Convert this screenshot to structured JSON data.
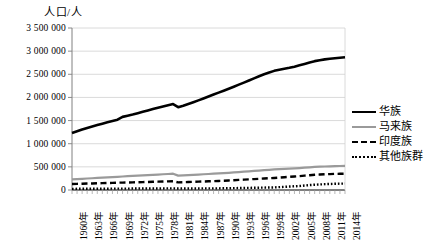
{
  "chart": {
    "axis_title": "人口/人",
    "legend_position": "right"
  },
  "chart_data": {
    "type": "line",
    "title": "",
    "xlabel": "",
    "ylabel": "人口/人",
    "ylim": [
      0,
      3500000
    ],
    "ytick_labels": [
      "0",
      "500 000",
      "1 000 000",
      "1 500 000",
      "2 000 000",
      "2 500 000",
      "3 000 000",
      "3 500 000"
    ],
    "ytick_values": [
      0,
      500000,
      1000000,
      1500000,
      2000000,
      2500000,
      3000000,
      3500000
    ],
    "grid": true,
    "legend": [
      "华族",
      "马来族",
      "印度族",
      "其他族群"
    ],
    "x": [
      1960,
      1961,
      1962,
      1963,
      1964,
      1965,
      1966,
      1967,
      1968,
      1969,
      1970,
      1971,
      1972,
      1973,
      1974,
      1975,
      1976,
      1977,
      1978,
      1979,
      1980,
      1981,
      1982,
      1983,
      1984,
      1985,
      1986,
      1987,
      1988,
      1989,
      1990,
      1991,
      1992,
      1993,
      1994,
      1995,
      1996,
      1997,
      1998,
      1999,
      2000,
      2001,
      2002,
      2003,
      2004,
      2005,
      2006,
      2007,
      2008,
      2009,
      2010,
      2011,
      2012,
      2013,
      2014
    ],
    "xtick_labels": [
      "1960年",
      "1963年",
      "1966年",
      "1969年",
      "1972年",
      "1975年",
      "1978年",
      "1981年",
      "1984年",
      "1987年",
      "1990年",
      "1993年",
      "1996年",
      "1999年",
      "2002年",
      "2005年",
      "2008年",
      "2011年",
      "2014年"
    ],
    "xtick_years": [
      1960,
      1963,
      1966,
      1969,
      1972,
      1975,
      1978,
      1981,
      1984,
      1987,
      1990,
      1993,
      1996,
      1999,
      2002,
      2005,
      2008,
      2011,
      2014
    ],
    "series": [
      {
        "name": "华族",
        "style": "solid",
        "color": "#000000",
        "values": [
          1230000,
          1268000,
          1305000,
          1340000,
          1372000,
          1402000,
          1432000,
          1462000,
          1492000,
          1520000,
          1580000,
          1605000,
          1630000,
          1658000,
          1688000,
          1718000,
          1748000,
          1778000,
          1805000,
          1832000,
          1856000,
          1790000,
          1822000,
          1858000,
          1896000,
          1936000,
          1978000,
          2020000,
          2062000,
          2104000,
          2145000,
          2188000,
          2232000,
          2276000,
          2320000,
          2366000,
          2412000,
          2458000,
          2500000,
          2538000,
          2574000,
          2600000,
          2620000,
          2640000,
          2665000,
          2694000,
          2724000,
          2756000,
          2784000,
          2804000,
          2822000,
          2836000,
          2848000,
          2858000,
          2868000
        ],
        "color_hex": "#000000"
      },
      {
        "name": "马来族",
        "style": "solid",
        "color": "#9a9a9a",
        "values": [
          230000,
          236000,
          242000,
          248000,
          254000,
          260000,
          266000,
          272000,
          278000,
          284000,
          292000,
          298000,
          304000,
          310000,
          316000,
          322000,
          328000,
          334000,
          340000,
          346000,
          352000,
          310000,
          316000,
          322000,
          328000,
          334000,
          340000,
          346000,
          352000,
          358000,
          364000,
          372000,
          380000,
          388000,
          396000,
          404000,
          412000,
          420000,
          428000,
          436000,
          444000,
          450000,
          456000,
          462000,
          468000,
          474000,
          482000,
          490000,
          498000,
          504000,
          508000,
          512000,
          516000,
          519000,
          522000
        ],
        "color_hex": "#9a9a9a"
      },
      {
        "name": "印度族",
        "style": "dashed",
        "color": "#000000",
        "values": [
          130000,
          133000,
          136000,
          139000,
          142000,
          145000,
          148000,
          151000,
          154000,
          157000,
          160000,
          162000,
          165000,
          168000,
          171000,
          174000,
          177000,
          180000,
          183000,
          186000,
          189000,
          165000,
          168000,
          172000,
          176000,
          180000,
          184000,
          188000,
          192000,
          196000,
          200000,
          206000,
          212000,
          218000,
          224000,
          230000,
          236000,
          242000,
          248000,
          254000,
          260000,
          268000,
          276000,
          284000,
          292000,
          300000,
          310000,
          320000,
          328000,
          334000,
          340000,
          344000,
          348000,
          350000,
          352000
        ],
        "color_hex": "#000000"
      },
      {
        "name": "其他族群",
        "style": "dotted",
        "color": "#000000",
        "values": [
          25000,
          25500,
          26000,
          26500,
          27000,
          27500,
          28000,
          28500,
          29000,
          29500,
          30000,
          30500,
          31000,
          31500,
          32000,
          32500,
          33000,
          33500,
          34000,
          34500,
          35000,
          32000,
          32500,
          33000,
          33500,
          34000,
          34500,
          35000,
          35500,
          36000,
          36500,
          38000,
          40000,
          42000,
          44000,
          46000,
          48000,
          50000,
          52000,
          54000,
          56000,
          62000,
          68000,
          74000,
          80000,
          86000,
          96000,
          106000,
          114000,
          120000,
          126000,
          130000,
          134000,
          137000,
          140000
        ],
        "color_hex": "#000000"
      }
    ]
  }
}
